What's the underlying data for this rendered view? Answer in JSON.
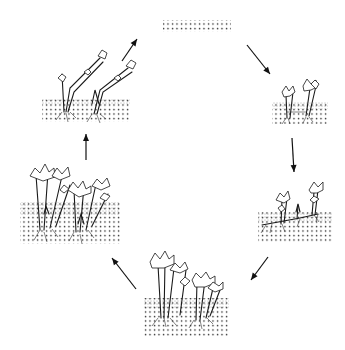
{
  "diagram": {
    "type": "cycle",
    "background": "#ffffff",
    "ink_color": "#1a1a1a",
    "stages": [
      {
        "id": "stage-1",
        "name": "bare-soil",
        "position": "top",
        "soil": {
          "x": 163,
          "y": 20,
          "w": 68,
          "h": 12
        },
        "plants": 0
      },
      {
        "id": "stage-2",
        "name": "young-shoots",
        "position": "right-upper",
        "soil": {
          "x": 272,
          "y": 102,
          "w": 56,
          "h": 22
        },
        "plants": 2
      },
      {
        "id": "stage-3",
        "name": "spreading-rhizome",
        "position": "right-lower",
        "soil": {
          "x": 258,
          "y": 212,
          "w": 75,
          "h": 30
        },
        "plants": 3
      },
      {
        "id": "stage-4",
        "name": "dense-clump",
        "position": "bottom",
        "soil": {
          "x": 144,
          "y": 298,
          "w": 85,
          "h": 38
        },
        "plants": 6
      },
      {
        "id": "stage-5",
        "name": "mature-stand",
        "position": "left-lower",
        "soil": {
          "x": 20,
          "y": 202,
          "w": 100,
          "h": 42
        },
        "plants": 8
      },
      {
        "id": "stage-6",
        "name": "senescent-stems",
        "position": "left-upper",
        "soil": {
          "x": 42,
          "y": 98,
          "w": 88,
          "h": 24
        },
        "plants": 2
      }
    ],
    "arrows": [
      {
        "from": "stage-6",
        "to": "stage-1",
        "x1": 122,
        "y1": 61,
        "x2": 137,
        "y2": 39
      },
      {
        "from": "stage-1",
        "to": "stage-2",
        "x1": 247,
        "y1": 45,
        "x2": 270,
        "y2": 74
      },
      {
        "from": "stage-2",
        "to": "stage-3",
        "x1": 292,
        "y1": 138,
        "x2": 294,
        "y2": 172
      },
      {
        "from": "stage-3",
        "to": "stage-4",
        "x1": 268,
        "y1": 257,
        "x2": 251,
        "y2": 280
      },
      {
        "from": "stage-4",
        "to": "stage-5",
        "x1": 136,
        "y1": 289,
        "x2": 112,
        "y2": 258
      },
      {
        "from": "stage-5",
        "to": "stage-6",
        "x1": 86,
        "y1": 160,
        "x2": 86,
        "y2": 134
      }
    ]
  }
}
